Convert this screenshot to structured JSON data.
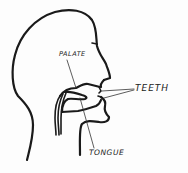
{
  "diagram": {
    "type": "anatomical-sketch",
    "labels": {
      "palate": "PALATE",
      "teeth": "TEETH",
      "tongue": "TONGUE"
    },
    "colors": {
      "ink": "#1a1a1a",
      "paper": "#fdfdfd"
    }
  }
}
